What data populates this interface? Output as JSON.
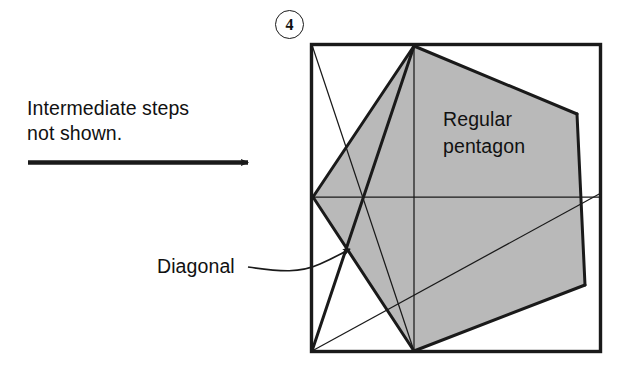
{
  "figure": {
    "step_number": "4",
    "instruction_text": "Intermediate steps\nnot shown.",
    "diagonal_label": "Diagonal",
    "pentagon_label": "Regular\npentagon",
    "colors": {
      "ink": "#1a1a1a",
      "pentagon_fill": "#b9b9b9",
      "paper": "#ffffff"
    },
    "geometry": {
      "square_bounds": {
        "x": 311,
        "y": 44,
        "width": 290,
        "height": 308
      },
      "pentagon_vertices": [
        {
          "name": "top",
          "x": 414,
          "y": 46
        },
        {
          "name": "upper-right",
          "x": 577,
          "y": 114
        },
        {
          "name": "lower-right",
          "x": 585,
          "y": 285
        },
        {
          "name": "bottom",
          "x": 414,
          "y": 351
        },
        {
          "name": "left",
          "x": 313,
          "y": 197
        }
      ],
      "crease_lines": [
        {
          "name": "square-top-left-to-crossing-diagonal",
          "x1": 311,
          "y1": 44,
          "x2": 414,
          "y2": 351
        },
        {
          "name": "pentagon-top-to-bottom-left-corner",
          "x1": 414,
          "y1": 46,
          "x2": 311,
          "y2": 352
        },
        {
          "name": "horizontal-crease-left-to-right",
          "x1": 311,
          "y1": 197,
          "x2": 601,
          "y2": 197
        },
        {
          "name": "vertical-crease-top-to-bottom",
          "x1": 414,
          "y1": 44,
          "x2": 414,
          "y2": 352
        },
        {
          "name": "bottom-left-to-upper-right-diagonal",
          "x1": 311,
          "y1": 352,
          "x2": 601,
          "y2": 194
        },
        {
          "name": "lower-right-to-bottom-left",
          "x1": 585,
          "y1": 285,
          "x2": 311,
          "y2": 352
        }
      ],
      "arrow": {
        "x1": 28,
        "y1": 162,
        "x2": 257,
        "y2": 162
      },
      "pointer": {
        "path": "M 289,267 C 320,272 340,262 352,252",
        "tip": {
          "x": 355,
          "y": 250
        }
      }
    }
  }
}
